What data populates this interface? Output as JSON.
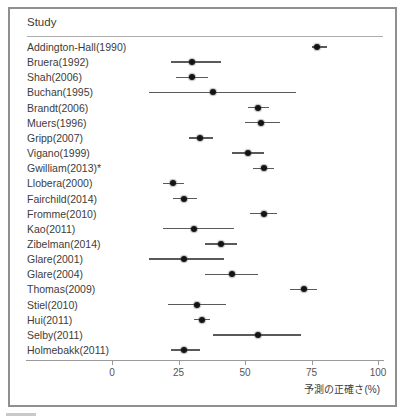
{
  "frame": {
    "header": "Study"
  },
  "axis": {
    "ticks": [
      0,
      25,
      50,
      75,
      100
    ],
    "label": "予測の正確さ(%)"
  },
  "chart_data": {
    "type": "scatter",
    "variant": "forest-plot",
    "title": "",
    "xlabel": "予測の正確さ(%)",
    "ylabel": "Study",
    "xlim": [
      0,
      100
    ],
    "grid": false,
    "marker": "black-dot-with-horizontal-ci-line",
    "studies": [
      {
        "label": "Addington-Hall(1990)",
        "estimate": 77,
        "ci": [
          75,
          81
        ]
      },
      {
        "label": "Bruera(1992)",
        "estimate": 30,
        "ci": [
          22,
          41
        ]
      },
      {
        "label": "Shah(2006)",
        "estimate": 30,
        "ci": [
          24,
          36
        ]
      },
      {
        "label": "Buchan(1995)",
        "estimate": 38,
        "ci": [
          14,
          69
        ]
      },
      {
        "label": "Brandt(2006)",
        "estimate": 55,
        "ci": [
          51,
          59
        ]
      },
      {
        "label": "Muers(1996)",
        "estimate": 56,
        "ci": [
          50,
          63
        ]
      },
      {
        "label": "Gripp(2007)",
        "estimate": 33,
        "ci": [
          29,
          38
        ]
      },
      {
        "label": "Vigano(1999)",
        "estimate": 51,
        "ci": [
          45,
          57
        ]
      },
      {
        "label": "Gwilliam(2013)*",
        "estimate": 57,
        "ci": [
          53,
          61
        ]
      },
      {
        "label": "Llobera(2000)",
        "estimate": 23,
        "ci": [
          19,
          27
        ]
      },
      {
        "label": "Fairchild(2014)",
        "estimate": 27,
        "ci": [
          23,
          32
        ]
      },
      {
        "label": "Fromme(2010)",
        "estimate": 57,
        "ci": [
          52,
          62
        ]
      },
      {
        "label": "Kao(2011)",
        "estimate": 31,
        "ci": [
          19,
          46
        ]
      },
      {
        "label": "Zibelman(2014)",
        "estimate": 41,
        "ci": [
          35,
          47
        ]
      },
      {
        "label": "Glare(2001)",
        "estimate": 27,
        "ci": [
          14,
          42
        ]
      },
      {
        "label": "Glare(2004)",
        "estimate": 45,
        "ci": [
          35,
          55
        ]
      },
      {
        "label": "Thomas(2009)",
        "estimate": 72,
        "ci": [
          67,
          77
        ]
      },
      {
        "label": "Stiel(2010)",
        "estimate": 32,
        "ci": [
          21,
          43
        ]
      },
      {
        "label": "Hui(2011)",
        "estimate": 34,
        "ci": [
          31,
          37
        ]
      },
      {
        "label": "Selby(2011)",
        "estimate": 55,
        "ci": [
          38,
          71
        ]
      },
      {
        "label": "Holmebakk(2011)",
        "estimate": 27,
        "ci": [
          22,
          33
        ]
      }
    ],
    "colors": {
      "marker": "#141414",
      "ci_line": "#5a5a5a",
      "frame_border": "#8f8f8f",
      "axis": "#9a9a9a",
      "text": "#3c3c3c"
    }
  }
}
